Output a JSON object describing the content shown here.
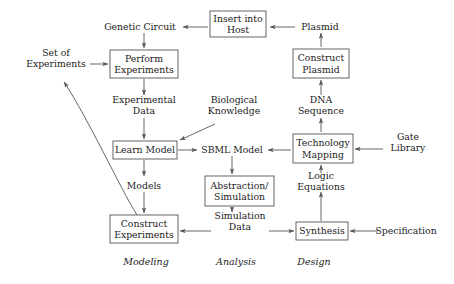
{
  "diagram": {
    "stroke_color": "#555555",
    "text_color": "#1a1a1a",
    "background_color": "#ffffff",
    "boxes": [
      {
        "id": "insert_into_host",
        "lines": [
          "Insert into",
          "Host"
        ],
        "x": 210,
        "y": 11,
        "w": 56,
        "h": 26
      },
      {
        "id": "perform_experiments",
        "lines": [
          "Perform",
          "Experiments"
        ],
        "x": 110,
        "y": 50,
        "w": 68,
        "h": 28
      },
      {
        "id": "construct_plasmid",
        "lines": [
          "Construct",
          "Plasmid"
        ],
        "x": 293,
        "y": 49,
        "w": 56,
        "h": 29
      },
      {
        "id": "learn_model",
        "lines": [
          "Learn Model"
        ],
        "x": 113,
        "y": 141,
        "w": 64,
        "h": 18
      },
      {
        "id": "technology_mapping",
        "lines": [
          "Technology",
          "Mapping"
        ],
        "x": 293,
        "y": 134,
        "w": 60,
        "h": 29
      },
      {
        "id": "abstraction_simulation",
        "lines": [
          "Abstraction/",
          "Simulation"
        ],
        "x": 205,
        "y": 176,
        "w": 69,
        "h": 30
      },
      {
        "id": "construct_experiments",
        "lines": [
          "Construct",
          "Experiments"
        ],
        "x": 110,
        "y": 215,
        "w": 68,
        "h": 28
      },
      {
        "id": "synthesis",
        "lines": [
          "Synthesis"
        ],
        "x": 296,
        "y": 222,
        "w": 52,
        "h": 18
      }
    ],
    "free_labels": [
      {
        "id": "genetic_circuit",
        "lines": [
          "Genetic Circuit"
        ],
        "cx": 140,
        "cy": 27
      },
      {
        "id": "plasmid",
        "lines": [
          "Plasmid"
        ],
        "cx": 320,
        "cy": 27
      },
      {
        "id": "set_of_experiments",
        "lines": [
          "Set of",
          "Experiments"
        ],
        "cx": 56,
        "cy": 58
      },
      {
        "id": "experimental_data",
        "lines": [
          "Experimental",
          "Data"
        ],
        "cx": 144,
        "cy": 105
      },
      {
        "id": "biological_knowledge",
        "lines": [
          "Biological",
          "Knowledge"
        ],
        "cx": 234,
        "cy": 105
      },
      {
        "id": "dna_sequence",
        "lines": [
          "DNA",
          "Sequence"
        ],
        "cx": 321,
        "cy": 105
      },
      {
        "id": "sbml_model",
        "lines": [
          "SBML Model"
        ],
        "cx": 232,
        "cy": 150
      },
      {
        "id": "gate_library",
        "lines": [
          "Gate",
          "Library"
        ],
        "cx": 408,
        "cy": 142
      },
      {
        "id": "models",
        "lines": [
          "Models"
        ],
        "cx": 144,
        "cy": 186
      },
      {
        "id": "logic_equations",
        "lines": [
          "Logic",
          "Equations"
        ],
        "cx": 321,
        "cy": 181
      },
      {
        "id": "simulation_data",
        "lines": [
          "Simulation",
          "Data"
        ],
        "cx": 240,
        "cy": 221
      },
      {
        "id": "specification",
        "lines": [
          "Specification"
        ],
        "cx": 406,
        "cy": 231
      }
    ],
    "phase_labels": [
      {
        "id": "modeling",
        "text": "Modeling",
        "cx": 146,
        "cy": 262
      },
      {
        "id": "analysis",
        "text": "Analysis",
        "cx": 236,
        "cy": 262
      },
      {
        "id": "design",
        "text": "Design",
        "cx": 314,
        "cy": 262
      }
    ],
    "edges": [
      {
        "id": "insert-host-to-genetic-circuit",
        "from": "insert_into_host",
        "to": "genetic_circuit"
      },
      {
        "id": "genetic-circuit-to-perform",
        "from": "genetic_circuit",
        "to": "perform_experiments"
      },
      {
        "id": "set-of-experiments-to-perform",
        "from": "set_of_experiments",
        "to": "perform_experiments"
      },
      {
        "id": "perform-to-experimental-data",
        "from": "perform_experiments",
        "to": "experimental_data"
      },
      {
        "id": "experimental-data-to-learn-model",
        "from": "experimental_data",
        "to": "learn_model"
      },
      {
        "id": "biological-knowledge-to-learn-model",
        "from": "biological_knowledge",
        "to": "learn_model"
      },
      {
        "id": "learn-model-to-sbml",
        "from": "learn_model",
        "to": "sbml_model"
      },
      {
        "id": "learn-model-to-models",
        "from": "learn_model",
        "to": "models"
      },
      {
        "id": "models-to-construct-experiments",
        "from": "models",
        "to": "construct_experiments"
      },
      {
        "id": "construct-experiments-to-set-of",
        "from": "construct_experiments",
        "to": "set_of_experiments"
      },
      {
        "id": "sbml-to-abstraction",
        "from": "sbml_model",
        "to": "abstraction_simulation"
      },
      {
        "id": "abstraction-to-simulation-data",
        "from": "abstraction_simulation",
        "to": "simulation_data"
      },
      {
        "id": "simulation-data-to-construct-exp",
        "from": "simulation_data",
        "to": "construct_experiments"
      },
      {
        "id": "simulation-data-to-synthesis",
        "from": "simulation_data",
        "to": "synthesis"
      },
      {
        "id": "specification-to-synthesis",
        "from": "specification",
        "to": "synthesis"
      },
      {
        "id": "synthesis-to-logic-equations",
        "from": "synthesis",
        "to": "logic_equations"
      },
      {
        "id": "logic-equations-to-tech-mapping",
        "from": "logic_equations",
        "to": "technology_mapping"
      },
      {
        "id": "gate-library-to-tech-mapping",
        "from": "gate_library",
        "to": "technology_mapping"
      },
      {
        "id": "tech-mapping-to-sbml",
        "from": "technology_mapping",
        "to": "sbml_model"
      },
      {
        "id": "tech-mapping-to-dna-sequence",
        "from": "technology_mapping",
        "to": "dna_sequence"
      },
      {
        "id": "dna-sequence-to-construct-plasmid",
        "from": "dna_sequence",
        "to": "construct_plasmid"
      },
      {
        "id": "construct-plasmid-to-plasmid",
        "from": "construct_plasmid",
        "to": "plasmid"
      },
      {
        "id": "plasmid-to-insert-into-host",
        "from": "plasmid",
        "to": "insert_into_host"
      }
    ]
  }
}
